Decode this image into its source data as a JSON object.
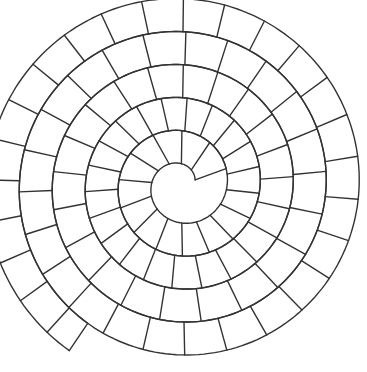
{
  "diagram": {
    "type": "spiral-board",
    "colors": {
      "line": "#333333",
      "background": "#ffffff"
    },
    "geometry": {
      "center_x": 181,
      "center_y": 185,
      "start_radius": 15,
      "spacing_per_turn": 33,
      "turns": 4.6,
      "start_angle_deg": -20,
      "cell_length_px": 38
    }
  }
}
